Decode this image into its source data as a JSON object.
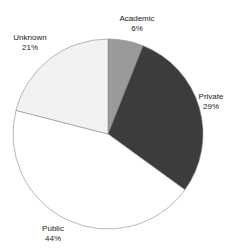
{
  "chart_data": {
    "type": "pie",
    "title": "",
    "categories": [
      "Academic",
      "Private",
      "Public",
      "Unknown"
    ],
    "values": [
      6,
      29,
      44,
      21
    ],
    "unit": "%",
    "start_angle": "12 o'clock, clockwise",
    "slices": [
      {
        "label": "Academic",
        "value": 6,
        "display": "6%",
        "color": "#9a9a9a"
      },
      {
        "label": "Private",
        "value": 29,
        "display": "29%",
        "color": "#3c3c3c"
      },
      {
        "label": "Public",
        "value": 44,
        "display": "44%",
        "color": "#ffffff"
      },
      {
        "label": "Unknown",
        "value": 21,
        "display": "21%",
        "color": "#f2f2f2"
      }
    ],
    "legend": "none (labels placed outside slices)"
  }
}
